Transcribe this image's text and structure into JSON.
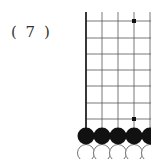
{
  "diagram": {
    "label": "( 7 )",
    "board": {
      "grid_color": "#555555",
      "edge_color": "#222222",
      "columns_x": [
        86,
        102,
        118,
        134,
        150
      ],
      "rows_y": [
        21,
        38,
        54,
        70,
        86,
        103,
        119
      ],
      "line_top": 12,
      "line_bottom": 128,
      "left_edge": true,
      "star_points": [
        {
          "x": 134,
          "y": 21
        },
        {
          "x": 134,
          "y": 119
        }
      ],
      "black_stones": [
        {
          "x": 86,
          "y": 136
        },
        {
          "x": 102,
          "y": 136
        },
        {
          "x": 118,
          "y": 136
        },
        {
          "x": 134,
          "y": 136
        },
        {
          "x": 150,
          "y": 136
        }
      ],
      "white_stones": [
        {
          "x": 86,
          "y": 153
        },
        {
          "x": 102,
          "y": 153
        },
        {
          "x": 118,
          "y": 153
        },
        {
          "x": 134,
          "y": 153
        },
        {
          "x": 150,
          "y": 153
        }
      ],
      "black_color": "#111111",
      "white_stroke": "#666666",
      "stone_radius": 8.5
    }
  }
}
